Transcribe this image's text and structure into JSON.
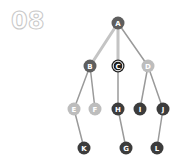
{
  "step": {
    "number": "08"
  },
  "graph": {
    "title": "tree traversal step",
    "colors": {
      "highlight_edge": "#c4c4c4",
      "normal_edge": "#9a9a9a",
      "visited": "#5e5e5e",
      "current": "#1e1e1e",
      "current_ring": "#ffffff",
      "frontier": "#bdbdbd",
      "unvisited": "#3c3c3c",
      "label": "#ffffff"
    },
    "nodes": [
      {
        "id": "A",
        "label": "A",
        "x": 118,
        "y": 23,
        "state": "visited"
      },
      {
        "id": "B",
        "label": "B",
        "x": 90,
        "y": 66,
        "state": "visited"
      },
      {
        "id": "C",
        "label": "C",
        "x": 118,
        "y": 66,
        "state": "current"
      },
      {
        "id": "D",
        "label": "D",
        "x": 148,
        "y": 66,
        "state": "frontier"
      },
      {
        "id": "E",
        "label": "E",
        "x": 74,
        "y": 109,
        "state": "frontier"
      },
      {
        "id": "F",
        "label": "F",
        "x": 95,
        "y": 109,
        "state": "frontier"
      },
      {
        "id": "H",
        "label": "H",
        "x": 118,
        "y": 109,
        "state": "unvisited"
      },
      {
        "id": "I",
        "label": "I",
        "x": 140,
        "y": 109,
        "state": "unvisited"
      },
      {
        "id": "J",
        "label": "J",
        "x": 163,
        "y": 109,
        "state": "unvisited"
      },
      {
        "id": "K",
        "label": "K",
        "x": 84,
        "y": 148,
        "state": "unvisited"
      },
      {
        "id": "G",
        "label": "G",
        "x": 126,
        "y": 148,
        "state": "unvisited"
      },
      {
        "id": "L",
        "label": "L",
        "x": 157,
        "y": 148,
        "state": "unvisited"
      }
    ],
    "edges": [
      {
        "from": "A",
        "to": "B",
        "highlighted": true
      },
      {
        "from": "A",
        "to": "C",
        "highlighted": true
      },
      {
        "from": "A",
        "to": "D",
        "highlighted": false
      },
      {
        "from": "B",
        "to": "E",
        "highlighted": false
      },
      {
        "from": "B",
        "to": "F",
        "highlighted": false
      },
      {
        "from": "C",
        "to": "H",
        "highlighted": false
      },
      {
        "from": "D",
        "to": "I",
        "highlighted": false
      },
      {
        "from": "D",
        "to": "J",
        "highlighted": false
      },
      {
        "from": "E",
        "to": "K",
        "highlighted": false
      },
      {
        "from": "H",
        "to": "G",
        "highlighted": false
      },
      {
        "from": "J",
        "to": "L",
        "highlighted": false
      }
    ]
  }
}
